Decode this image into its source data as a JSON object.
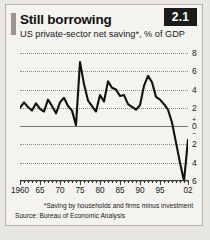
{
  "badge": {
    "label": "2.1"
  },
  "header": {
    "title": "Still borrowing",
    "subtitle": "US private-sector net saving*, % of GDP"
  },
  "footnotes": {
    "note": "*Saving by households and firms minus investment",
    "source": "Source: Bureau of Economic Analysis"
  },
  "colors": {
    "card_background": "#f5f3ef",
    "page_background": "#e9e7e2",
    "badge_background": "#1b1b1b",
    "badge_text": "#ffffff",
    "line": "#111111",
    "gridline": "#8d8a85",
    "zeroline": "#77746f",
    "accent_bar": "#9a9791"
  },
  "chart_data": {
    "type": "line",
    "title": "Still borrowing",
    "subtitle": "US private-sector net saving*, % of GDP",
    "xlabel": "",
    "ylabel": "% of GDP",
    "ylim": [
      -6,
      8
    ],
    "yticks": [
      8,
      6,
      4,
      2,
      0,
      -2,
      -4,
      -6
    ],
    "ytick_labels": [
      "8",
      "6",
      "4",
      "2",
      "0",
      "2",
      "4",
      "6"
    ],
    "zero_label_signs": {
      "above": "+",
      "below": "−"
    },
    "grid": true,
    "legend": null,
    "xlim": [
      1960,
      2002
    ],
    "xticks": [
      1960,
      1965,
      1970,
      1975,
      1980,
      1985,
      1990,
      1995,
      2002
    ],
    "xtick_labels": [
      "1960",
      "65",
      "70",
      "75",
      "80",
      "85",
      "90",
      "95",
      "02"
    ],
    "minor_xtick_interval": 1,
    "series": [
      {
        "name": "US private-sector net saving",
        "x": [
          1960,
          1961,
          1962,
          1963,
          1964,
          1965,
          1966,
          1967,
          1968,
          1969,
          1970,
          1971,
          1972,
          1973,
          1974,
          1975,
          1976,
          1977,
          1978,
          1979,
          1980,
          1981,
          1982,
          1983,
          1984,
          1985,
          1986,
          1987,
          1988,
          1989,
          1990,
          1991,
          1992,
          1993,
          1994,
          1995,
          1996,
          1997,
          1998,
          1999,
          2000,
          2001,
          2002
        ],
        "values": [
          2.0,
          2.6,
          2.1,
          1.7,
          2.5,
          1.9,
          1.6,
          2.9,
          2.2,
          1.4,
          2.6,
          3.1,
          2.2,
          1.7,
          0.1,
          7.0,
          4.6,
          2.8,
          2.2,
          1.6,
          3.4,
          2.7,
          4.9,
          4.2,
          4.0,
          3.3,
          3.4,
          2.4,
          2.1,
          1.8,
          2.3,
          4.4,
          5.5,
          4.8,
          3.2,
          2.9,
          2.4,
          1.8,
          0.4,
          -1.8,
          -4.0,
          -6.0,
          -1.5
        ]
      }
    ]
  }
}
